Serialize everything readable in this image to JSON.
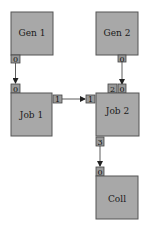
{
  "diagram": {
    "type": "dataflow",
    "nodes": [
      {
        "id": "gen1",
        "label": "Gen 1"
      },
      {
        "id": "gen2",
        "label": "Gen 2"
      },
      {
        "id": "job1",
        "label": "Job 1"
      },
      {
        "id": "job2",
        "label": "Job 2"
      },
      {
        "id": "coll",
        "label": "Coll"
      }
    ],
    "ports": [
      {
        "id": "gen1-out0",
        "node": "gen1",
        "label": "0"
      },
      {
        "id": "gen2-out0",
        "node": "gen2",
        "label": "0"
      },
      {
        "id": "job1-in0",
        "node": "job1",
        "label": "0"
      },
      {
        "id": "job1-out1",
        "node": "job1",
        "label": "1"
      },
      {
        "id": "job2-in1",
        "node": "job2",
        "label": "1"
      },
      {
        "id": "job2-in2",
        "node": "job2",
        "label": "2"
      },
      {
        "id": "job2-in0",
        "node": "job2",
        "label": "0"
      },
      {
        "id": "job2-out3",
        "node": "job2",
        "label": "3"
      },
      {
        "id": "coll-in0",
        "node": "coll",
        "label": "0"
      }
    ],
    "edges": [
      {
        "from": "gen1-out0",
        "to": "job1-in0"
      },
      {
        "from": "gen2-out0",
        "to": "job2-in0"
      },
      {
        "from": "job1-out1",
        "to": "job2-in1"
      },
      {
        "from": "job2-out3",
        "to": "coll-in0"
      }
    ],
    "colors": {
      "node_fill": "#a8a8a8",
      "port_fill": "#9a9a9a",
      "edge": "#333333"
    }
  }
}
